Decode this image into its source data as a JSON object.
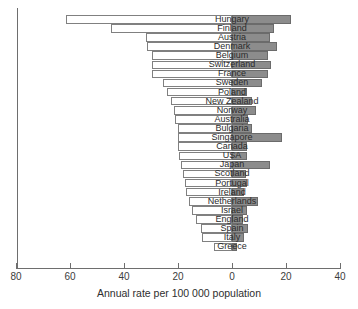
{
  "chart_data": {
    "type": "bar",
    "orientation": "horizontal",
    "title": "",
    "subtitle": "",
    "xlabel": "Annual rate per 100 000 population",
    "ylabel": "",
    "xlim": [
      -80,
      40
    ],
    "grid": false,
    "legend": null,
    "axis_tick_labels": [
      "80",
      "60",
      "40",
      "20",
      "0",
      "20",
      "40"
    ],
    "axis_tick_values": [
      -80,
      -60,
      -40,
      -20,
      0,
      20,
      40
    ],
    "categories": [
      "Hungary",
      "Finland",
      "Austria",
      "Denmark",
      "Belgium",
      "Switzerland",
      "France",
      "Sweden",
      "Poland",
      "New Zealand",
      "Norway",
      "Australia",
      "Bulgaria",
      "Singapore",
      "Canada",
      "USA",
      "Japan",
      "Scotland",
      "Portugal",
      "Ireland",
      "Netherlands",
      "Israel",
      "England",
      "Spain",
      "Italy",
      "Greece"
    ],
    "series": [
      {
        "name": "Male",
        "side": "left",
        "color": "#ffffff",
        "values": [
          61.5,
          45.0,
          32.0,
          31.5,
          29.5,
          29.5,
          29.5,
          25.5,
          24.0,
          22.5,
          21.5,
          21.0,
          20.0,
          20.0,
          20.0,
          19.5,
          19.0,
          18.0,
          17.5,
          17.0,
          16.0,
          15.0,
          13.5,
          11.5,
          11.0,
          6.5
        ]
      },
      {
        "name": "Female",
        "side": "right",
        "color": "#8c8c8c",
        "values": [
          22.0,
          15.5,
          14.0,
          16.5,
          13.5,
          14.5,
          13.5,
          11.0,
          5.5,
          7.5,
          9.0,
          6.0,
          7.5,
          18.5,
          5.5,
          5.5,
          14.0,
          5.0,
          5.5,
          4.5,
          9.5,
          5.5,
          4.0,
          6.0,
          4.5,
          2.0
        ]
      }
    ]
  }
}
